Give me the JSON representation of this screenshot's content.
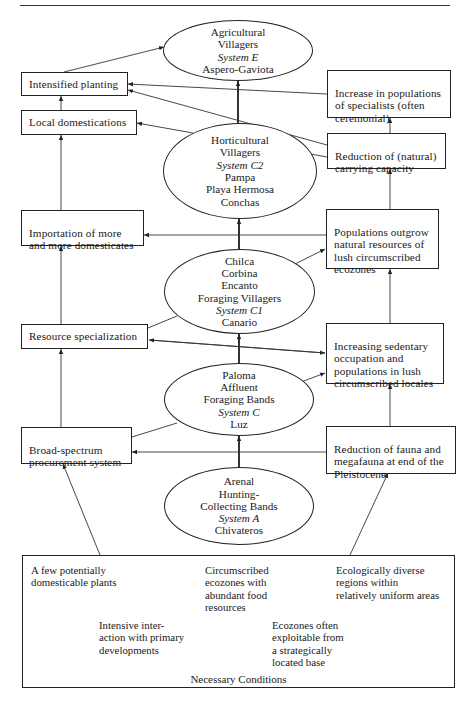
{
  "diagram": {
    "systems": {
      "E": {
        "lines": [
          "Agricultural",
          "Villagers"
        ],
        "system": "System E",
        "sites": [
          "Aspero-Gaviota"
        ]
      },
      "C2": {
        "lines": [
          "Horticultural",
          "Villagers"
        ],
        "system": "System C2",
        "sites": [
          "Pampa",
          "Playa Hermosa",
          "Conchas"
        ]
      },
      "C1": {
        "lines": [
          "Chilca",
          "Corbina",
          "Encanto",
          "Foraging Villagers"
        ],
        "system": "System C1",
        "sites": [
          "Canario"
        ]
      },
      "C": {
        "lines": [
          "Paloma",
          "Affluent",
          "Foraging Bands"
        ],
        "system": "System C",
        "sites": [
          "Luz"
        ]
      },
      "A": {
        "lines": [
          "Arenal",
          "Hunting-",
          "Collecting Bands"
        ],
        "system": "System A",
        "sites": [
          "Chivateros"
        ]
      }
    },
    "left_boxes": {
      "intensified_planting": "Intensified planting",
      "local_domestications": "Local domestications",
      "importation": "Importation of more\nand more domesticates",
      "resource_specialization": "Resource specialization",
      "broad_spectrum": "Broad-spectrum\nprocurement system"
    },
    "right_boxes": {
      "increase_specialists": "Increase in populations\nof specialists (often\nceremonial)",
      "reduction_capacity": "Reduction of (natural)\ncarrying capacity",
      "populations_outgrow": "Populations outgrow\nnatural resources of\nlush circumscribed\necozones",
      "increasing_sedentary": "Increasing sedentary\noccupation and\npopulations in lush\ncircumscribed locales",
      "reduction_fauna": "Reduction of fauna and\nmegafauna at end of the\nPleistocene"
    },
    "necessary_conditions": {
      "title": "Necessary Conditions",
      "items": [
        "A few potentially\ndomesticable plants",
        "Circumscribed\necozones with\nabundant food\nresources",
        "Ecologically diverse\nregions within\nrelatively uniform areas",
        "Intensive inter-\naction with primary\ndevelopments",
        "Ecozones often\nexploitable from\na strategically\nlocated base"
      ]
    }
  }
}
